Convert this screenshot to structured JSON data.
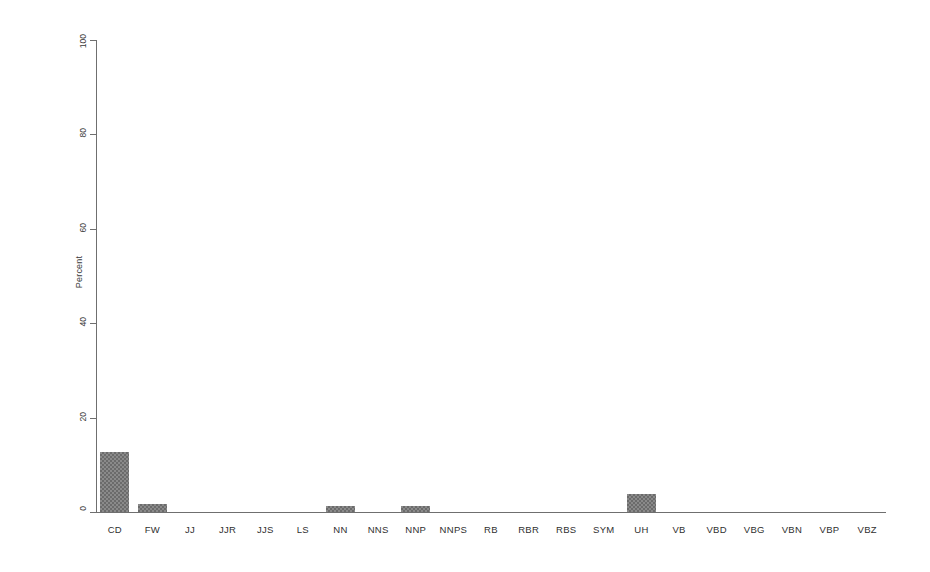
{
  "chart_data": {
    "type": "bar",
    "title": "",
    "subtitle": "",
    "xlabel": "",
    "ylabel": "Percent",
    "ylim": [
      0,
      100
    ],
    "yticks": [
      0,
      20,
      40,
      60,
      80,
      100
    ],
    "ytick_labels": [
      "0",
      "20",
      "40",
      "60",
      "80",
      "100"
    ],
    "grid": false,
    "legend": false,
    "legend_position": "none",
    "bar_fill": "#808080",
    "bar_pattern": "checkered-dither-gray",
    "axis_color": "#6f6f6f",
    "categories": [
      "CD",
      "FW",
      "JJ",
      "JJR",
      "JJS",
      "LS",
      "NN",
      "NNS",
      "NNP",
      "NNPS",
      "RB",
      "RBR",
      "RBS",
      "SYM",
      "UH",
      "VB",
      "VBD",
      "VBG",
      "VBN",
      "VBP",
      "VBZ"
    ],
    "values": [
      12.7,
      1.8,
      0,
      0,
      0,
      0,
      1.3,
      0,
      1.3,
      0,
      0,
      0,
      0,
      0,
      3.8,
      0,
      0,
      0,
      0,
      0,
      0
    ],
    "series": [
      {
        "name": "Percent",
        "values": [
          12.7,
          1.8,
          0,
          0,
          0,
          0,
          1.3,
          0,
          1.3,
          0,
          0,
          0,
          0,
          0,
          3.8,
          0,
          0,
          0,
          0,
          0,
          0
        ]
      }
    ]
  }
}
